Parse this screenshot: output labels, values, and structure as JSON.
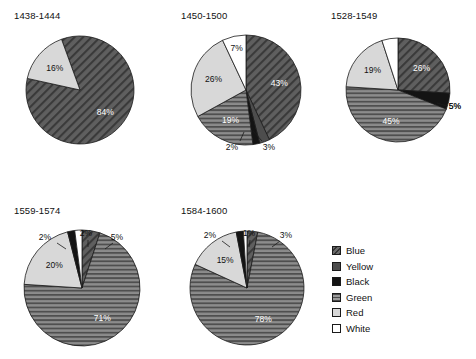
{
  "chart_data": {
    "type": "pie",
    "title": "",
    "units": "percent",
    "legend": {
      "position": "right-bottom",
      "entries": [
        {
          "label": "Blue",
          "pattern": "diagonal-hatch",
          "color": "#5a5a5a"
        },
        {
          "label": "Yellow",
          "pattern": "solid-dark",
          "color": "#4a4a4a"
        },
        {
          "label": "Black",
          "pattern": "solid-black",
          "color": "#111111"
        },
        {
          "label": "Green",
          "pattern": "horizontal-lines",
          "color": "#7d7d7d"
        },
        {
          "label": "Red",
          "pattern": "solid-light",
          "color": "#d5d5d5"
        },
        {
          "label": "White",
          "pattern": "solid-white",
          "color": "#ffffff"
        }
      ]
    },
    "categories": [
      "Blue",
      "Yellow",
      "Black",
      "Green",
      "Red",
      "White"
    ],
    "charts": [
      {
        "title": "1438-1444",
        "slices": [
          {
            "category": "Blue",
            "value": 84,
            "label": "84%"
          },
          {
            "category": "Red",
            "value": 16,
            "label": "16%"
          }
        ]
      },
      {
        "title": "1450-1500",
        "slices": [
          {
            "category": "Blue",
            "value": 43,
            "label": "43%"
          },
          {
            "category": "Yellow",
            "value": 3,
            "label": "3%"
          },
          {
            "category": "Black",
            "value": 2,
            "label": "2%"
          },
          {
            "category": "Green",
            "value": 19,
            "label": "19%"
          },
          {
            "category": "Red",
            "value": 26,
            "label": "26%"
          },
          {
            "category": "White",
            "value": 7,
            "label": "7%"
          }
        ]
      },
      {
        "title": "1528-1549",
        "slices": [
          {
            "category": "Blue",
            "value": 26,
            "label": "26%"
          },
          {
            "category": "Black",
            "value": 5,
            "label": "5%"
          },
          {
            "category": "Green",
            "value": 45,
            "label": "45%"
          },
          {
            "category": "Red",
            "value": 19,
            "label": "19%"
          },
          {
            "category": "White",
            "value": 5,
            "label": "5%"
          }
        ]
      },
      {
        "title": "1559-1574",
        "slices": [
          {
            "category": "Blue",
            "value": 5,
            "label": "5%"
          },
          {
            "category": "Green",
            "value": 71,
            "label": "71%"
          },
          {
            "category": "Red",
            "value": 20,
            "label": "20%"
          },
          {
            "category": "Black",
            "value": 2,
            "label": "2%"
          },
          {
            "category": "White",
            "value": 2,
            "label": "2%"
          }
        ]
      },
      {
        "title": "1584-1600",
        "slices": [
          {
            "category": "Blue",
            "value": 3,
            "label": "3%"
          },
          {
            "category": "Green",
            "value": 78,
            "label": "78%"
          },
          {
            "category": "Red",
            "value": 15,
            "label": "15%"
          },
          {
            "category": "Black",
            "value": 2,
            "label": "2%"
          },
          {
            "category": "White",
            "value": 1,
            "label": "1%"
          }
        ]
      }
    ]
  }
}
